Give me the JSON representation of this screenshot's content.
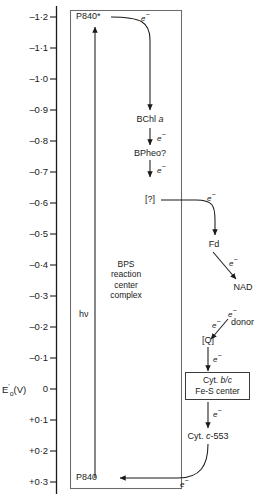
{
  "diagram": {
    "axis": {
      "label": "E'o(V)",
      "label_parts": {
        "base": "E",
        "prime": "'",
        "subscript": "o",
        "unit": "(V)"
      },
      "ticks": [
        {
          "value": -1.2,
          "text": "–1·2"
        },
        {
          "value": -1.1,
          "text": "–1·1"
        },
        {
          "value": -1.0,
          "text": "–1·0"
        },
        {
          "value": -0.9,
          "text": "–0·9"
        },
        {
          "value": -0.8,
          "text": "–0·8"
        },
        {
          "value": -0.7,
          "text": "–0·7"
        },
        {
          "value": -0.6,
          "text": "–0·6"
        },
        {
          "value": -0.5,
          "text": "–0·5"
        },
        {
          "value": -0.4,
          "text": "–0·4"
        },
        {
          "value": -0.3,
          "text": "–0·3"
        },
        {
          "value": -0.2,
          "text": "–0·2"
        },
        {
          "value": -0.1,
          "text": "–0·1"
        },
        {
          "value": 0.0,
          "text": "0"
        },
        {
          "value": 0.1,
          "text": "+0·1"
        },
        {
          "value": 0.2,
          "text": "+0·2"
        },
        {
          "value": 0.3,
          "text": "+0·3"
        }
      ]
    },
    "reaction_center": {
      "line1": "BPS",
      "line2": "reaction",
      "line3": "center",
      "line4": "complex"
    },
    "nodes": {
      "p840_excited": "P840*",
      "bchl": {
        "name": "BChl",
        "italic": "a"
      },
      "bpheo": "BPheo?",
      "unknown_acceptor": "[?]",
      "fd": "Fd",
      "nad": "NAD",
      "quinone": "[Q]",
      "cyt_bc_line1_pre": "Cyt. ",
      "cyt_bc_line1_it": "b/c",
      "cyt_bc_line2": "Fe-S center",
      "cyt_c553_pre": "Cyt. ",
      "cyt_c553_it": "c",
      "cyt_c553_post": "-553",
      "p840_ground": "P840",
      "donor": "donor",
      "photon": "hν"
    },
    "electron_label": "e",
    "electron_charge": "−",
    "electron_labels_count": 10,
    "colors": {
      "ink": "#1a1a1a",
      "line": "#3a3a3a",
      "background": "#ffffff"
    }
  }
}
